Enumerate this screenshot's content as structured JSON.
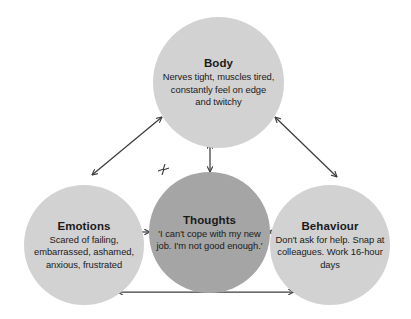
{
  "diagram": {
    "type": "cbt-cycle",
    "colors": {
      "background": "#ffffff",
      "node_light": "#d2d2d2",
      "node_dark": "#a5a5a5",
      "text": "#1a1a1a",
      "arrow": "#3c3c3c"
    },
    "nodes": [
      {
        "id": "body",
        "label": "Body",
        "text": "Nerves tight, muscles tired, constantly feel on edge and twitchy",
        "fill": "#d2d2d2"
      },
      {
        "id": "thoughts",
        "label": "Thoughts",
        "text": "'I can't cope with my new job. I'm not good enough.'",
        "fill": "#a5a5a5"
      },
      {
        "id": "emotions",
        "label": "Emotions",
        "text": "Scared of failing, embarrassed, ashamed, anxious, frustrated",
        "fill": "#d2d2d2"
      },
      {
        "id": "behaviour",
        "label": "Behaviour",
        "text": "Don't ask for help. Snap at colleagues. Work 16-hour days",
        "fill": "#d2d2d2"
      }
    ],
    "connectors": [
      {
        "id": "body-emotions",
        "from": "body",
        "to": "emotions",
        "style": "double-arrow"
      },
      {
        "id": "body-behaviour",
        "from": "body",
        "to": "behaviour",
        "style": "double-arrow"
      },
      {
        "id": "body-thoughts",
        "from": "body",
        "to": "thoughts",
        "style": "double-arrow"
      },
      {
        "id": "emotions-thoughts",
        "from": "emotions",
        "to": "thoughts",
        "style": "double-arrow"
      },
      {
        "id": "thoughts-behaviour",
        "from": "thoughts",
        "to": "behaviour",
        "style": "double-arrow"
      },
      {
        "id": "emotions-behaviour",
        "from": "emotions",
        "to": "behaviour",
        "style": "double-arrow"
      }
    ]
  }
}
